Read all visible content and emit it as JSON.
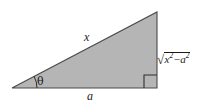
{
  "figure": {
    "kind": "right-triangle-diagram",
    "background_color": "#ffffff",
    "fill_color": "#b5b5b5",
    "stroke_color": "#4a4a4a",
    "label_color": "#1a1a1a",
    "vertices": {
      "left": [
        12,
        88
      ],
      "bottom_right": [
        157,
        88
      ],
      "top_right": [
        157,
        12
      ]
    },
    "right_angle_marker": {
      "x": 144,
      "y": 75,
      "size": 13
    },
    "angle_arc": {
      "center": [
        12,
        88
      ],
      "radius": 25,
      "label": "theta"
    }
  },
  "labels": {
    "hypotenuse": "x",
    "base": "a",
    "angle": "θ",
    "vertical_leg": {
      "full": "√(x² − a²)",
      "radicand_first_var": "x",
      "radicand_first_exp": "2",
      "operator": "−",
      "radicand_second_var": "a",
      "radicand_second_exp": "2",
      "radical_sign": "√"
    }
  }
}
